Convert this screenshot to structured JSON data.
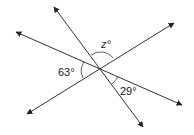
{
  "diagram": {
    "type": "intersecting-lines-angles",
    "center": [
      100,
      68
    ],
    "lines": [
      {
        "name": "steep-line",
        "from": [
          54,
          7
        ],
        "to": [
          143,
          127
        ]
      },
      {
        "name": "shallow-falling-line",
        "from": [
          16,
          32
        ],
        "to": [
          182,
          105
        ]
      },
      {
        "name": "rising-line",
        "from": [
          27,
          114
        ],
        "to": [
          174,
          23
        ]
      }
    ],
    "labels": {
      "z": "z°",
      "a63": "63°",
      "a29": "29°"
    },
    "colors": {
      "line": "#333333",
      "text": "#222222"
    }
  }
}
